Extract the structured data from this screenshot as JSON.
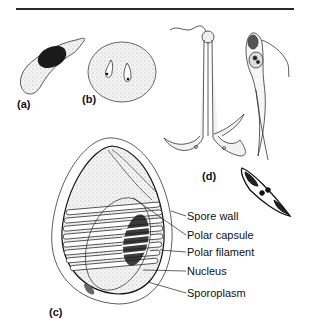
{
  "figure": {
    "panels": [
      {
        "id": "a",
        "label": "(a)",
        "subject": "crescent-shaped cell with dark nucleus"
      },
      {
        "id": "b",
        "label": "(b)",
        "subject": "round cyst with two pear-shaped bodies"
      },
      {
        "id": "c",
        "label": "(c)",
        "subject": "spore with coiled polar filament"
      },
      {
        "id": "d",
        "label": "(d)",
        "subject": "anchor-shaped and spindle-shaped spores"
      }
    ],
    "callouts": [
      {
        "text": "Spore wall"
      },
      {
        "text": "Polar capsule"
      },
      {
        "text": "Polar filament"
      },
      {
        "text": "Nucleus"
      },
      {
        "text": "Sporoplasm"
      }
    ],
    "colors": {
      "ink": "#1a1a1a",
      "stipple": "#d8d8d8",
      "background": "#ffffff"
    }
  }
}
